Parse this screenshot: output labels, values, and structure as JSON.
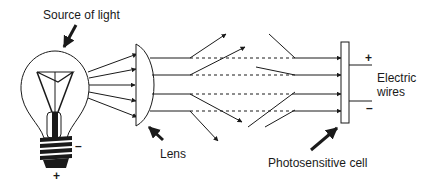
{
  "diagram": {
    "labels": {
      "source": "Source of light",
      "lens": "Lens",
      "cell": "Photosensitive cell",
      "wires_line1": "Electric",
      "wires_line2": "wires"
    },
    "signs": {
      "bulb_minus": "–",
      "bulb_plus": "+",
      "wire_plus": "+",
      "wire_minus": "–"
    },
    "components": [
      "light-bulb",
      "lens",
      "light-rays",
      "photosensitive-cell",
      "electric-wires"
    ],
    "colors": {
      "ink": "#1a1a1a",
      "background": "#ffffff"
    }
  }
}
